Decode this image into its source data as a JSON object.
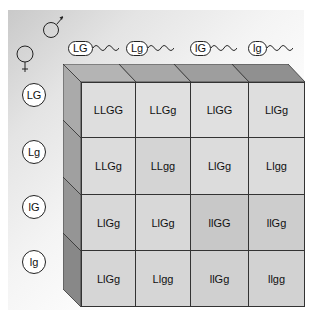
{
  "diagram": {
    "male_symbol": "male-symbol",
    "female_symbol": "female-symbol",
    "male_gametes": [
      "LG",
      "Lg",
      "lG",
      "lg"
    ],
    "female_gametes": [
      "LG",
      "Lg",
      "lG",
      "lg"
    ],
    "grid": [
      [
        "LLGG",
        "LLGg",
        "LlGG",
        "LlGg"
      ],
      [
        "LLGg",
        "LLgg",
        "LlGg",
        "Llgg"
      ],
      [
        "LlGg",
        "LlGg",
        "llGG",
        "llGg"
      ],
      [
        "LlGg",
        "Llgg",
        "llGg",
        "llgg"
      ]
    ],
    "cell_colors": [
      [
        "#dedede",
        "#e0e0e0",
        "#e0e0e0",
        "#dedede"
      ],
      [
        "#dcdcdc",
        "#d4d4d4",
        "#dcdcdc",
        "#dcdcdc"
      ],
      [
        "#d8d8d8",
        "#d8d8d8",
        "#c8c8c8",
        "#cdcdcd"
      ],
      [
        "#d6d6d6",
        "#d6d6d6",
        "#d0d0d0",
        "#d2d2d2"
      ]
    ],
    "top_face_colors": [
      "#b4b4b4",
      "#a8a8a8",
      "#9e9e9e",
      "#909090"
    ],
    "left_face_colors": [
      "#aaaaaa",
      "#a0a0a0",
      "#959595",
      "#888888"
    ],
    "border_color": "#333333"
  }
}
